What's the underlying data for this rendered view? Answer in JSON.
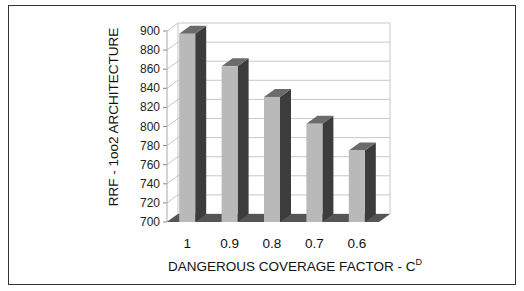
{
  "chart_data": {
    "type": "bar",
    "style": "3d-column",
    "title": "",
    "xlabel": "DANGEROUS COVERAGE FACTOR - C",
    "xlabel_superscript": "D",
    "ylabel": "RRF -  1oo2 ARCHITECTURE",
    "categories": [
      "1",
      "0.9",
      "0.8",
      "0.7",
      "0.6"
    ],
    "values": [
      897,
      863,
      831,
      803,
      775
    ],
    "ylim": [
      700,
      900
    ],
    "yticks": [
      700,
      720,
      740,
      760,
      780,
      800,
      820,
      840,
      860,
      880,
      900
    ],
    "grid": true,
    "legend": null,
    "colors": {
      "front": "#b9b9b9",
      "side": "#3c3c3c",
      "top": "#6b6b6b",
      "floor": "#555555",
      "grid": "#c8c8c8"
    }
  }
}
